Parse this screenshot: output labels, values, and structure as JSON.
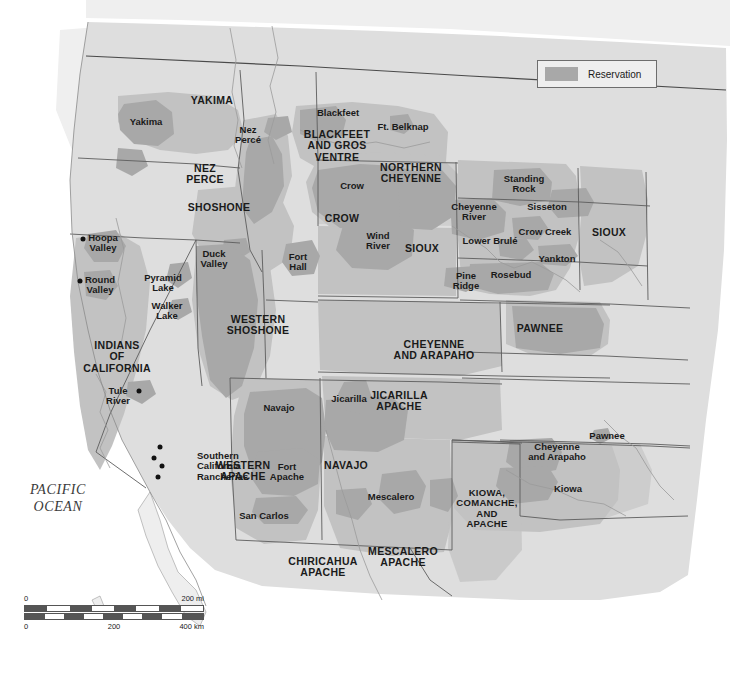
{
  "map": {
    "title_visible": false,
    "colors": {
      "background": "#ffffff",
      "land": "#dedede",
      "land_outside": "#ebebeb",
      "territory": "#c2c2c2",
      "reservation": "#a8a8a8",
      "border": "#5c5c5c",
      "coast": "#8a8a8a",
      "text": "#1a1a1a"
    },
    "ocean_label": "PACIFIC\nOCEAN"
  },
  "legend": {
    "swatch_color": "#a8a8a8",
    "label": "Reservation"
  },
  "scalebar": {
    "miles": {
      "start": "0",
      "end": "200 mi"
    },
    "km": {
      "start": "0",
      "mid": "200",
      "end": "400 km"
    }
  },
  "labels": {
    "major": [
      {
        "text": "YAKIMA",
        "x": 212,
        "y": 101
      },
      {
        "text": "NEZ\nPERCE",
        "x": 205,
        "y": 174
      },
      {
        "text": "SHOSHONE",
        "x": 219,
        "y": 208
      },
      {
        "text": "BLACKFEET\nAND GROS\nVENTRE",
        "x": 337,
        "y": 146
      },
      {
        "text": "NORTHERN\nCHEYENNE",
        "x": 411,
        "y": 173
      },
      {
        "text": "CROW",
        "x": 342,
        "y": 219
      },
      {
        "text": "SIOUX",
        "x": 422,
        "y": 249
      },
      {
        "text": "SIOUX",
        "x": 609,
        "y": 233
      },
      {
        "text": "PAWNEE",
        "x": 540,
        "y": 329
      },
      {
        "text": "INDIANS\nOF\nCALIFORNIA",
        "x": 117,
        "y": 357
      },
      {
        "text": "WESTERN\nSHOSHONE",
        "x": 258,
        "y": 325
      },
      {
        "text": "CHEYENNE\nAND ARAPAHO",
        "x": 434,
        "y": 350
      },
      {
        "text": "JICARILLA\nAPACHE",
        "x": 399,
        "y": 401
      },
      {
        "text": "WESTERN\nAPACHE",
        "x": 243,
        "y": 471
      },
      {
        "text": "NAVAJO",
        "x": 346,
        "y": 466
      },
      {
        "text": "KIOWA,\nCOMANCHE,\nAND\nAPACHE",
        "x": 487,
        "y": 508
      },
      {
        "text": "CHIRICAHUA\nAPACHE",
        "x": 323,
        "y": 567
      },
      {
        "text": "MESCALERO\nAPACHE",
        "x": 403,
        "y": 557
      }
    ],
    "minor": [
      {
        "text": "Yakima",
        "x": 146,
        "y": 122,
        "align": "center"
      },
      {
        "text": "Nez\nPercé",
        "x": 248,
        "y": 135,
        "align": "center"
      },
      {
        "text": "Blackfeet",
        "x": 338,
        "y": 113,
        "align": "center"
      },
      {
        "text": "Ft. Belknap",
        "x": 403,
        "y": 127,
        "align": "center"
      },
      {
        "text": "Crow",
        "x": 352,
        "y": 186,
        "align": "center"
      },
      {
        "text": "Wind\nRiver",
        "x": 378,
        "y": 241,
        "align": "center"
      },
      {
        "text": "Fort\nHall",
        "x": 298,
        "y": 262,
        "align": "center"
      },
      {
        "text": "Duck\nValley",
        "x": 214,
        "y": 259,
        "align": "center"
      },
      {
        "text": "Standing\nRock",
        "x": 524,
        "y": 184,
        "align": "center"
      },
      {
        "text": "Sisseton",
        "x": 547,
        "y": 207,
        "align": "center"
      },
      {
        "text": "Cheyenne\nRiver",
        "x": 474,
        "y": 212,
        "align": "center"
      },
      {
        "text": "Crow Creek",
        "x": 545,
        "y": 232,
        "align": "center"
      },
      {
        "text": "Lower Brulé",
        "x": 490,
        "y": 241,
        "align": "center"
      },
      {
        "text": "Yankton",
        "x": 557,
        "y": 259,
        "align": "center"
      },
      {
        "text": "Pine\nRidge",
        "x": 466,
        "y": 281,
        "align": "center"
      },
      {
        "text": "Rosebud",
        "x": 511,
        "y": 275,
        "align": "center"
      },
      {
        "text": "Hoopa\nValley",
        "x": 103,
        "y": 243,
        "align": "center"
      },
      {
        "text": "Round\nValley",
        "x": 100,
        "y": 285,
        "align": "center"
      },
      {
        "text": "Pyramid\nLake",
        "x": 163,
        "y": 283,
        "align": "center"
      },
      {
        "text": "Walker\nLake",
        "x": 167,
        "y": 311,
        "align": "center"
      },
      {
        "text": "Tule\nRiver",
        "x": 118,
        "y": 396,
        "align": "center"
      },
      {
        "text": "Southern\nCalifornia\nRancherias",
        "x": 197,
        "y": 466,
        "align": "left"
      },
      {
        "text": "Navajo",
        "x": 279,
        "y": 408,
        "align": "center"
      },
      {
        "text": "Jicarilla",
        "x": 349,
        "y": 399,
        "align": "center"
      },
      {
        "text": "Fort\nApache",
        "x": 287,
        "y": 472,
        "align": "center"
      },
      {
        "text": "San Carlos",
        "x": 264,
        "y": 516,
        "align": "center"
      },
      {
        "text": "Mescalero",
        "x": 391,
        "y": 497,
        "align": "center"
      },
      {
        "text": "Pawnee",
        "x": 607,
        "y": 436,
        "align": "center"
      },
      {
        "text": "Cheyenne\nand Arapaho",
        "x": 557,
        "y": 452,
        "align": "center"
      },
      {
        "text": "Kiowa",
        "x": 568,
        "y": 489,
        "align": "center"
      }
    ],
    "dots": [
      {
        "name": "hoopa-valley-dot",
        "x": 83,
        "y": 239
      },
      {
        "name": "round-valley-dot",
        "x": 80,
        "y": 281
      },
      {
        "name": "tule-river-dot",
        "x": 139,
        "y": 391
      },
      {
        "name": "rancheria-dot-1",
        "x": 160,
        "y": 447
      },
      {
        "name": "rancheria-dot-2",
        "x": 154,
        "y": 458
      },
      {
        "name": "rancheria-dot-3",
        "x": 162,
        "y": 466
      },
      {
        "name": "rancheria-dot-4",
        "x": 158,
        "y": 477
      }
    ]
  }
}
